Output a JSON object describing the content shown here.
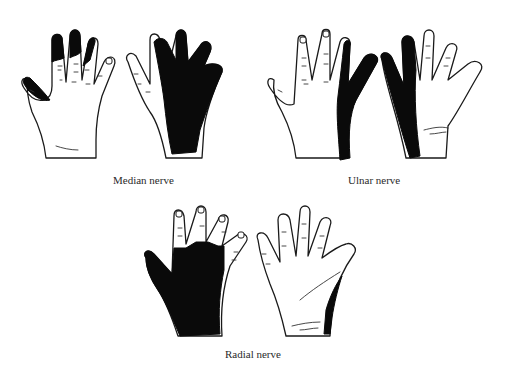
{
  "figure": {
    "panels": [
      {
        "id": "median",
        "caption": "Median nerve",
        "views": [
          "dorsal",
          "palmar"
        ],
        "shaded_region": "palmar lateral 3.5 digits; dorsal fingertips of index, middle, half ring; thumb tip"
      },
      {
        "id": "ulnar",
        "caption": "Ulnar nerve",
        "views": [
          "dorsal",
          "palmar"
        ],
        "shaded_region": "medial 1.5 digits (little finger and half ring) on both surfaces"
      },
      {
        "id": "radial",
        "caption": "Radial nerve",
        "views": [
          "dorsal",
          "palmar"
        ],
        "shaded_region": "dorsal lateral hand and proximal lateral 3.5 digits; small thenar strip on palm"
      }
    ],
    "colors": {
      "shading": "#0a0a0a",
      "outline": "#1a1a1a",
      "background": "#ffffff"
    }
  }
}
